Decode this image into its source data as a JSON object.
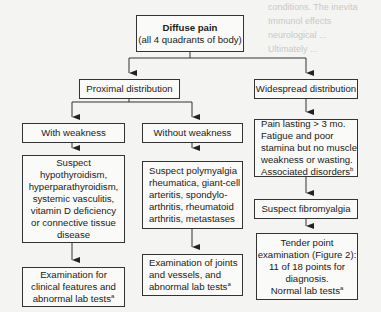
{
  "background_text": [
    "conditions. The inevita",
    "Immunol effects",
    "neurological ...",
    "Ultimately ..."
  ],
  "nodes": {
    "root": {
      "title": "Diffuse pain",
      "subtitle": "(all 4 quadrants of body)"
    },
    "proximal": "Proximal distribution",
    "widespread": "Widespread distribution",
    "with_weakness": "With weakness",
    "without_weakness": "Without weakness",
    "suspect_hypo": [
      "Suspect",
      "hypothyroidism,",
      "hyperparathyroidism,",
      "systemic vasculitis,",
      "vitamin D deficiency",
      "or connective tissue",
      "disease"
    ],
    "suspect_pmr": [
      "Suspect polymyalgia",
      "rheumatica, giant-cell",
      "arteritis, spondylo-",
      "arthritis, rheumatoid",
      "arthritis, metastases"
    ],
    "pain_lasting": [
      "Pain lasting > 3 mo.",
      "Fatigue and poor",
      "stamina but no muscle",
      "weakness or wasting.",
      "Associated disorders"
    ],
    "pain_lasting_sup": "b",
    "suspect_fibro": "Suspect fibromyalgia",
    "exam_clinical": [
      "Examination for",
      "clinical features and",
      "abnormal lab tests"
    ],
    "exam_joints": [
      "Examination of joints",
      "and vessels, and",
      "abnormal lab tests"
    ],
    "tender_point": [
      "Tender point",
      "examination (Figure 2):",
      "11 of 18 points for",
      "diagnosis.",
      "Normal lab tests"
    ],
    "footnote_a": "a"
  }
}
